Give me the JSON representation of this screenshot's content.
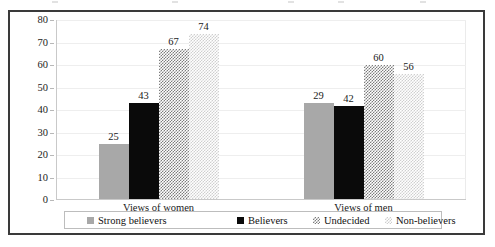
{
  "chart_data": {
    "type": "bar",
    "title": "",
    "subtitle": "",
    "xlabel": "",
    "ylabel": "",
    "ylim": [
      0,
      80
    ],
    "ytick_step": 10,
    "ytick_labels": [
      "80",
      "70",
      "60",
      "50",
      "40",
      "30",
      "20",
      "10",
      "0"
    ],
    "ytick_values": [
      80,
      70,
      60,
      50,
      40,
      30,
      20,
      10,
      0
    ],
    "grid": true,
    "grid_axis": "y",
    "legend_position": "bottom",
    "categories": [
      "Views of women",
      "Views of men"
    ],
    "series": [
      {
        "name": "Strong believers",
        "values": [
          25,
          43
        ],
        "fill": "solid-gray",
        "color": "#a8a8a8"
      },
      {
        "name": "Believers",
        "values": [
          43,
          42
        ],
        "fill": "solid-black",
        "color": "#0a0a0a"
      },
      {
        "name": "Undecided",
        "values": [
          67,
          60
        ],
        "fill": "checker-dark",
        "color": "#7d7d7d"
      },
      {
        "name": "Non-believers",
        "values": [
          74,
          56
        ],
        "fill": "checker-light",
        "color": "#cfcfcf"
      }
    ],
    "data_labels": {
      "Views of women": [
        "25",
        "43",
        "67",
        "74"
      ],
      "Views of men": [
        "29",
        "42",
        "60",
        "56"
      ]
    },
    "values_matrix": [
      [
        25,
        43,
        67,
        74
      ],
      [
        29,
        42,
        60,
        56
      ]
    ]
  },
  "legend": {
    "items": [
      {
        "label": "Strong believers"
      },
      {
        "label": "Believers"
      },
      {
        "label": "Undecided"
      },
      {
        "label": "Non-believers"
      }
    ]
  },
  "colors": {
    "frame_border": "#3a3a3a",
    "gridline": "#eeeeee",
    "axis": "#c9c9c9",
    "text": "#1a1a1a",
    "legend_border": "#bdbdbd",
    "background": "#ffffff"
  }
}
